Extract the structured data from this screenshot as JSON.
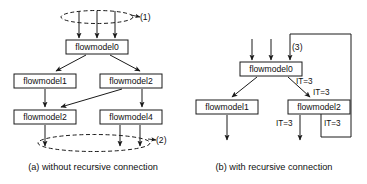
{
  "figure": {
    "background_color": "#ffffff",
    "line_color": "#1a1a1a",
    "text_color": "#0f0f0f"
  },
  "panel_a": {
    "caption": "(a) without recursive connection",
    "nodes": [
      {
        "id": "a-fm0",
        "label": "flowmodel0",
        "x": 66,
        "y": 40,
        "w": 62,
        "h": 14
      },
      {
        "id": "a-fm1",
        "label": "flowmodel1",
        "x": 14,
        "y": 74,
        "w": 62,
        "h": 14
      },
      {
        "id": "a-fm2r",
        "label": "flowmodel2",
        "x": 100,
        "y": 74,
        "w": 62,
        "h": 14
      },
      {
        "id": "a-fm2b",
        "label": "flowmodel2",
        "x": 14,
        "y": 110,
        "w": 62,
        "h": 14
      },
      {
        "id": "a-fm4",
        "label": "flowmodel4",
        "x": 100,
        "y": 110,
        "w": 62,
        "h": 14
      }
    ],
    "annotations": [
      {
        "id": "a-tag-1",
        "label": "(1)",
        "x": 134,
        "y": 17
      },
      {
        "id": "a-tag-2",
        "label": "(2)",
        "x": 160,
        "y": 140
      }
    ],
    "ellipses": [
      {
        "id": "a-ellipse-top",
        "cx": 97,
        "cy": 17,
        "rx": 36,
        "ry": 6.5
      },
      {
        "id": "a-ellipse-bottom",
        "cx": 94,
        "cy": 143,
        "rx": 56,
        "ry": 8.5
      }
    ]
  },
  "panel_b": {
    "caption": "(b) with recursive connection",
    "nodes": [
      {
        "id": "b-fm0",
        "label": "flowmodel0",
        "x": 240,
        "y": 62,
        "w": 62,
        "h": 14
      },
      {
        "id": "b-fm1",
        "label": "flowmodel1",
        "x": 196,
        "y": 100,
        "w": 62,
        "h": 14
      },
      {
        "id": "b-fm2",
        "label": "flowmodel2",
        "x": 288,
        "y": 100,
        "w": 62,
        "h": 14
      }
    ],
    "annotations": [
      {
        "id": "b-tag-3",
        "label": "(3)",
        "x": 292,
        "y": 48
      },
      {
        "id": "b-it-fm0",
        "label": "IT=3",
        "x": 298,
        "y": 82
      },
      {
        "id": "b-it-in2",
        "label": "IT=3",
        "x": 312,
        "y": 93
      },
      {
        "id": "b-it-out",
        "label": "IT=3",
        "x": 278,
        "y": 124
      },
      {
        "id": "b-it-loop",
        "label": "IT=3",
        "x": 326,
        "y": 124
      }
    ]
  }
}
